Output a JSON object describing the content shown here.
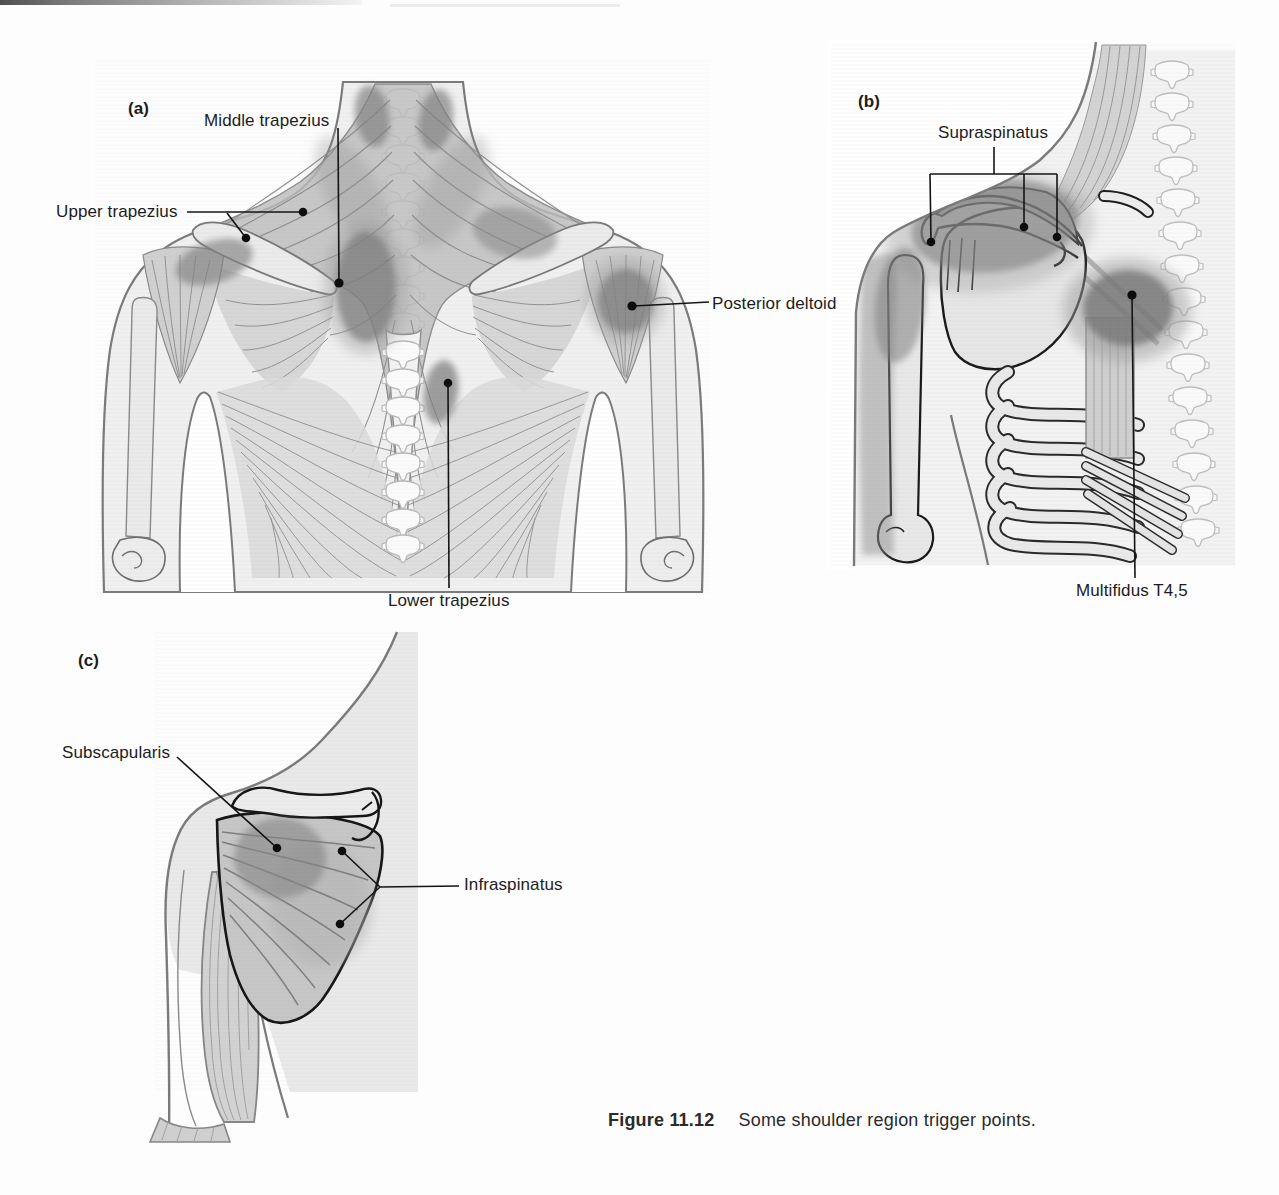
{
  "figure": {
    "caption": {
      "label": "Figure 11.12",
      "text": "Some shoulder region trigger points."
    },
    "panels": [
      {
        "id": "a",
        "letter": "(a)",
        "labels": [
          {
            "id": "middle-trapezius",
            "text": "Middle trapezius"
          },
          {
            "id": "upper-trapezius",
            "text": "Upper trapezius"
          },
          {
            "id": "posterior-deltoid",
            "text": "Posterior deltoid"
          },
          {
            "id": "lower-trapezius",
            "text": "Lower trapezius"
          }
        ]
      },
      {
        "id": "b",
        "letter": "(b)",
        "labels": [
          {
            "id": "supraspinatus",
            "text": "Supraspinatus"
          },
          {
            "id": "multifidus-t45",
            "text": "Multifidus T4,5"
          }
        ]
      },
      {
        "id": "c",
        "letter": "(c)",
        "labels": [
          {
            "id": "subscapularis",
            "text": "Subscapularis"
          },
          {
            "id": "infraspinatus",
            "text": "Infraspinatus"
          }
        ]
      }
    ]
  },
  "colors": {
    "page": "#fdfdfd",
    "label_text": "#1c1c1c",
    "leader_line": "#141414",
    "trigger_zone": "#828282",
    "muscle": "#c9c9c9",
    "bone": "#ebebeb",
    "outline": "#7b7b7b"
  }
}
